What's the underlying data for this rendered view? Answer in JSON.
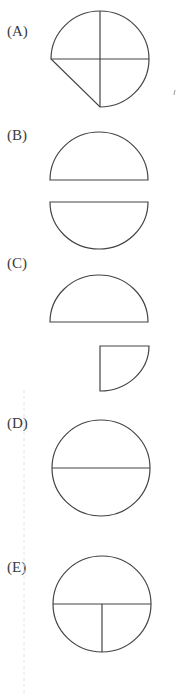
{
  "figure": {
    "options": [
      {
        "id": "A",
        "label": "(A)",
        "description": "Three-quarter circle: top-left quarter, top-right quarter and bottom-right quarter with horizontal and vertical radii"
      },
      {
        "id": "B",
        "label": "(B)",
        "description": "Two separated semicircles: upper semicircle and lower semicircle"
      },
      {
        "id": "C",
        "label": "(C)",
        "description": "Upper semicircle and a separate bottom-right quarter circle"
      },
      {
        "id": "D",
        "label": "(D)",
        "description": "Full circle divided by a horizontal diameter"
      },
      {
        "id": "E",
        "label": "(E)",
        "description": "Full circle divided by a horizontal diameter with a vertical radius in the lower half"
      }
    ],
    "stroke_color": "#444444",
    "background": "#ffffff"
  }
}
